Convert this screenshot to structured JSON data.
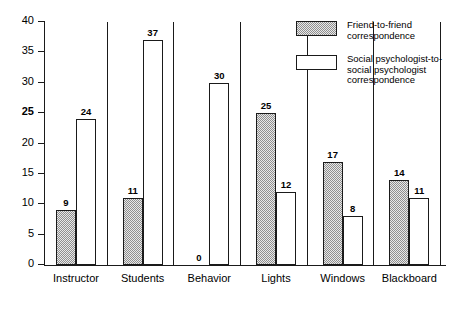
{
  "chart_data": {
    "type": "bar",
    "title": "",
    "xlabel": "",
    "ylabel": "",
    "ylim": [
      0,
      40
    ],
    "ytick_step": 5,
    "yticks": [
      "0",
      "5",
      "10",
      "15",
      "20",
      "25",
      "30",
      "35",
      "40"
    ],
    "grid": false,
    "legend_position": "top-right",
    "categories": [
      "Instructor",
      "Students",
      "Behavior",
      "Lights",
      "Windows",
      "Blackboard"
    ],
    "series": [
      {
        "name": "Friend-to-friend correspondence",
        "style": "shaded",
        "values": [
          9,
          11,
          0,
          25,
          17,
          14
        ],
        "labels": [
          "9",
          "11",
          "0",
          "25",
          "17",
          "14"
        ]
      },
      {
        "name": "Social psychologist-to-social psychologist correspondence",
        "style": "open",
        "values": [
          24,
          37,
          30,
          12,
          8,
          11
        ],
        "labels": [
          "24",
          "37",
          "30",
          "12",
          "8",
          "11"
        ]
      }
    ]
  },
  "legend": {
    "entries": [
      {
        "label": "Friend-to-friend\ncorrespondence",
        "swatch": "shaded"
      },
      {
        "label": "Social psychologist-to-\nsocial psychologist\ncorrespondence",
        "swatch": "open"
      }
    ]
  },
  "colors": {
    "line": "#1a1a1a",
    "shaded_fill": "#8f8f8f",
    "open_fill": "#ffffff",
    "background": "#ffffff",
    "text": "#000000"
  },
  "axes": {
    "y_min_label": "0",
    "y_max_label": "40"
  }
}
